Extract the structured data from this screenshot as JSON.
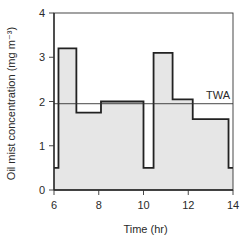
{
  "chart_data": {
    "type": "line",
    "subtype": "step-area",
    "title": "",
    "xlabel": "Time (hr)",
    "ylabel": "Oil mist concentration (mg m⁻³)",
    "xlim": [
      6,
      14
    ],
    "ylim": [
      0,
      4
    ],
    "xticks": [
      6,
      8,
      10,
      12,
      14
    ],
    "yticks": [
      0,
      1,
      2,
      3,
      4
    ],
    "grid": false,
    "legend": "none",
    "series": [
      {
        "name": "Oil mist concentration",
        "steps": [
          {
            "start": 6.0,
            "end": 6.2,
            "value": 0.5
          },
          {
            "start": 6.2,
            "end": 7.0,
            "value": 3.2
          },
          {
            "start": 7.0,
            "end": 8.1,
            "value": 1.75
          },
          {
            "start": 8.1,
            "end": 10.0,
            "value": 2.0
          },
          {
            "start": 10.0,
            "end": 10.45,
            "value": 0.5
          },
          {
            "start": 10.45,
            "end": 11.3,
            "value": 3.1
          },
          {
            "start": 11.3,
            "end": 12.2,
            "value": 2.05
          },
          {
            "start": 12.2,
            "end": 13.8,
            "value": 1.6
          },
          {
            "start": 13.8,
            "end": 14.0,
            "value": 0.5
          }
        ]
      }
    ],
    "annotations": [
      {
        "type": "hline",
        "label": "TWA",
        "value": 1.95
      }
    ],
    "colors": {
      "fill": "#e6e6e6",
      "line": "#222222",
      "axis": "#333333"
    }
  }
}
